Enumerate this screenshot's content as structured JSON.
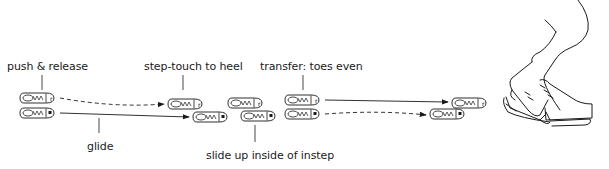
{
  "diagram": {
    "labels": {
      "push_release": "push & release",
      "step_touch": "step-touch to heel",
      "transfer": "transfer: toes even",
      "glide": "glide",
      "slide_up": "slide up inside of instep"
    },
    "skate_marks": {
      "top_foot_mark": "r",
      "bottom_foot_mark": "■"
    },
    "illustration": "skater-legs-crossover"
  }
}
